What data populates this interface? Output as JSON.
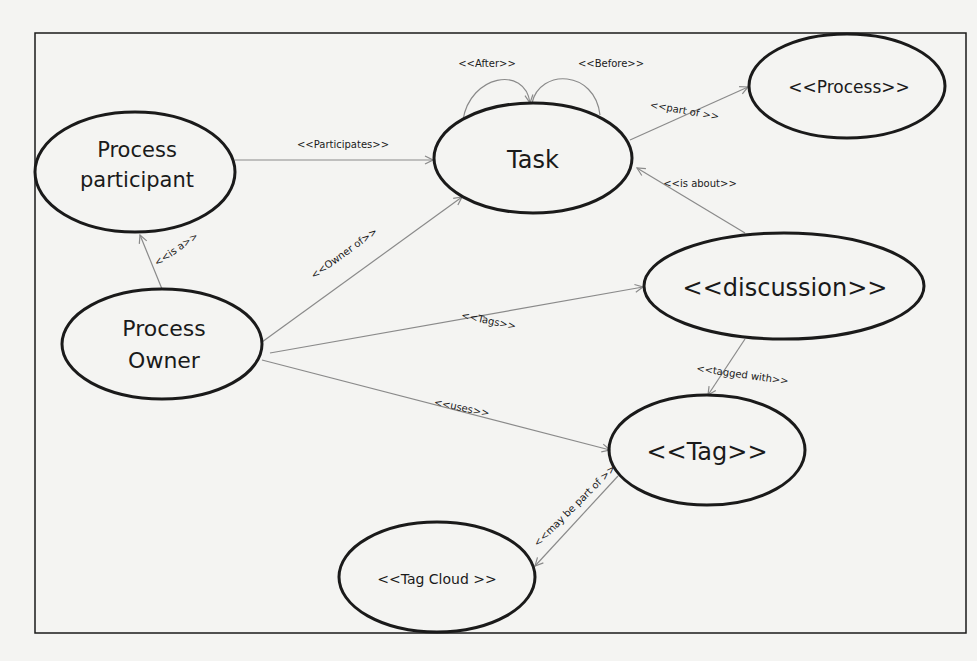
{
  "diagram": {
    "type": "use-case",
    "nodes": [
      {
        "id": "process_participant",
        "lines": [
          "Process",
          "participant"
        ]
      },
      {
        "id": "task",
        "lines": [
          "Task"
        ]
      },
      {
        "id": "process",
        "lines": [
          "<<Process>>"
        ]
      },
      {
        "id": "process_owner",
        "lines": [
          "Process",
          "Owner"
        ]
      },
      {
        "id": "discussion",
        "lines": [
          "<<discussion>>"
        ]
      },
      {
        "id": "tag",
        "lines": [
          "<<Tag>>"
        ]
      },
      {
        "id": "tag_cloud",
        "lines": [
          "<<Tag Cloud >>"
        ]
      }
    ],
    "edges": [
      {
        "from": "process_participant",
        "to": "task",
        "label": "<<Participates>>"
      },
      {
        "from": "task",
        "to": "task",
        "label": "<<After>>"
      },
      {
        "from": "task",
        "to": "task",
        "label": "<<Before>>"
      },
      {
        "from": "task",
        "to": "process",
        "label": "<<part of >>"
      },
      {
        "from": "discussion",
        "to": "task",
        "label": "<<is about>>"
      },
      {
        "from": "process_owner",
        "to": "process_participant",
        "label": "<<is a>>"
      },
      {
        "from": "process_owner",
        "to": "task",
        "label": "<<Owner of>>"
      },
      {
        "from": "process_owner",
        "to": "discussion",
        "label": "<<Tags>>"
      },
      {
        "from": "process_owner",
        "to": "tag",
        "label": "<<uses>>"
      },
      {
        "from": "discussion",
        "to": "tag",
        "label": "<<tagged with>>"
      },
      {
        "from": "tag",
        "to": "tag_cloud",
        "label": "<<may be part of >>"
      }
    ]
  },
  "colors": {
    "background": "#f4f4f2",
    "node_stroke": "#1a1a1a",
    "edge_stroke": "#8a8a8a",
    "frame_stroke": "#1a1a1a"
  }
}
